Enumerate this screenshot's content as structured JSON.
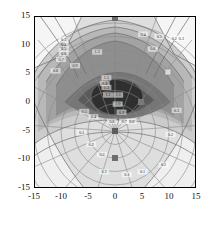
{
  "figure": {
    "background": "#ffffff",
    "plot_area": {
      "left": 34,
      "top": 16,
      "width": 162,
      "height": 172
    }
  },
  "chart_data": {
    "type": "heatmap",
    "subtype": "filled-contour-with-polar-grid",
    "title": "",
    "xlabel": "",
    "ylabel": "",
    "xlim": [
      -15,
      15
    ],
    "ylim": [
      -15,
      15
    ],
    "xticks": [
      -15,
      -10,
      -5,
      0,
      5,
      10,
      15
    ],
    "yticks": [
      -15,
      -10,
      -5,
      0,
      5,
      10,
      15
    ],
    "xticklabels": [
      "-15",
      "-10",
      "-5",
      "0",
      "5",
      "10",
      "15"
    ],
    "yticklabels": [
      "-15",
      "-10",
      "-5",
      "0",
      "5",
      "10",
      "15"
    ],
    "grid": true,
    "grid_type": "polar",
    "legend": "none",
    "colormap": "gray",
    "colorbar": false,
    "fill_levels": [
      {
        "level": 1,
        "color": "#2f2f2f"
      },
      {
        "level": 2,
        "color": "#5a5a5a"
      },
      {
        "level": 3,
        "color": "#767676"
      },
      {
        "level": 4,
        "color": "#8e8e8e"
      },
      {
        "level": 5,
        "color": "#a3a3a3"
      },
      {
        "level": 6,
        "color": "#b8b8b8"
      },
      {
        "level": 7,
        "color": "#cccccc"
      },
      {
        "level": 8,
        "color": "#dedede"
      },
      {
        "level": 9,
        "color": "#efefef"
      },
      {
        "level": 10,
        "color": "#fbfbfb"
      }
    ],
    "contour_line_color": "#6b6b6b",
    "polar_grid": {
      "origin": [
        0,
        -5
      ],
      "radii": [
        2.5,
        5,
        7.5,
        10,
        12.5,
        15,
        17.5,
        20
      ],
      "angles_deg": [
        0,
        20,
        40,
        60,
        80,
        100,
        120,
        140,
        160,
        180,
        200,
        220,
        240,
        260,
        280,
        300,
        320,
        340
      ]
    },
    "markers": [
      {
        "x": 0,
        "y": 15,
        "shape": "square",
        "color": "#6e6e6e"
      },
      {
        "x": -10,
        "y": 10,
        "shape": "square",
        "color": "#6e6e6e"
      },
      {
        "x": 9.5,
        "y": 5,
        "shape": "square",
        "color": "#d8d8d8"
      },
      {
        "x": 5,
        "y": 0,
        "shape": "square",
        "color": "#6e6e6e"
      },
      {
        "x": 0,
        "y": -5,
        "shape": "square",
        "color": "#5c5c5c"
      },
      {
        "x": 0,
        "y": -10,
        "shape": "square",
        "color": "#6e6e6e"
      }
    ],
    "contour_labels": [
      {
        "x": -9.5,
        "y": 10.6,
        "text": "0.3"
      },
      {
        "x": -9.5,
        "y": 9.8,
        "text": "0.4"
      },
      {
        "x": -9.5,
        "y": 9.0,
        "text": "0.5"
      },
      {
        "x": -9.5,
        "y": 8.2,
        "text": "0.6"
      },
      {
        "x": -10.0,
        "y": 7.2,
        "text": "0.7"
      },
      {
        "x": -11.0,
        "y": 5.2,
        "text": "0.8"
      },
      {
        "x": -7.4,
        "y": 6.1,
        "text": "0.9"
      },
      {
        "x": -3.3,
        "y": 8.5,
        "text": "1.2"
      },
      {
        "x": -1.6,
        "y": 4.0,
        "text": "1.5"
      },
      {
        "x": -1.9,
        "y": 3.0,
        "text": "1.4"
      },
      {
        "x": -1.6,
        "y": 2.3,
        "text": "1.3"
      },
      {
        "x": -1.3,
        "y": 1.0,
        "text": "1.1"
      },
      {
        "x": 0.6,
        "y": 1.0,
        "text": "1.1"
      },
      {
        "x": 0.5,
        "y": -0.6,
        "text": "1.0"
      },
      {
        "x": 1.2,
        "y": -2.0,
        "text": "0.9"
      },
      {
        "x": -0.6,
        "y": -3.6,
        "text": "0.8"
      },
      {
        "x": 1.7,
        "y": -3.6,
        "text": "0.7"
      },
      {
        "x": 3.1,
        "y": -3.6,
        "text": "0.6"
      },
      {
        "x": -5.7,
        "y": -1.9,
        "text": "0.5"
      },
      {
        "x": -4.0,
        "y": -2.8,
        "text": "0.4"
      },
      {
        "x": -6.2,
        "y": -5.6,
        "text": "0.3"
      },
      {
        "x": -4.4,
        "y": -7.6,
        "text": "0.2"
      },
      {
        "x": -2.4,
        "y": -9.4,
        "text": "0.2"
      },
      {
        "x": 11.0,
        "y": 10.9,
        "text": "0.2"
      },
      {
        "x": 12.3,
        "y": 10.9,
        "text": "0.3"
      },
      {
        "x": 5.2,
        "y": 11.6,
        "text": "0.4"
      },
      {
        "x": 8.2,
        "y": 11.2,
        "text": "0.5"
      },
      {
        "x": 7.0,
        "y": 9.0,
        "text": "0.6"
      },
      {
        "x": 11.4,
        "y": -1.7,
        "text": "0.3"
      },
      {
        "x": 10.3,
        "y": -5.9,
        "text": "0.2"
      },
      {
        "x": 9.0,
        "y": -11.2,
        "text": "0.2"
      },
      {
        "x": 5.1,
        "y": -12.4,
        "text": "0.1"
      },
      {
        "x": 2.2,
        "y": -12.9,
        "text": "0.1"
      },
      {
        "x": -2.0,
        "y": -12.4,
        "text": "0.1"
      }
    ]
  }
}
